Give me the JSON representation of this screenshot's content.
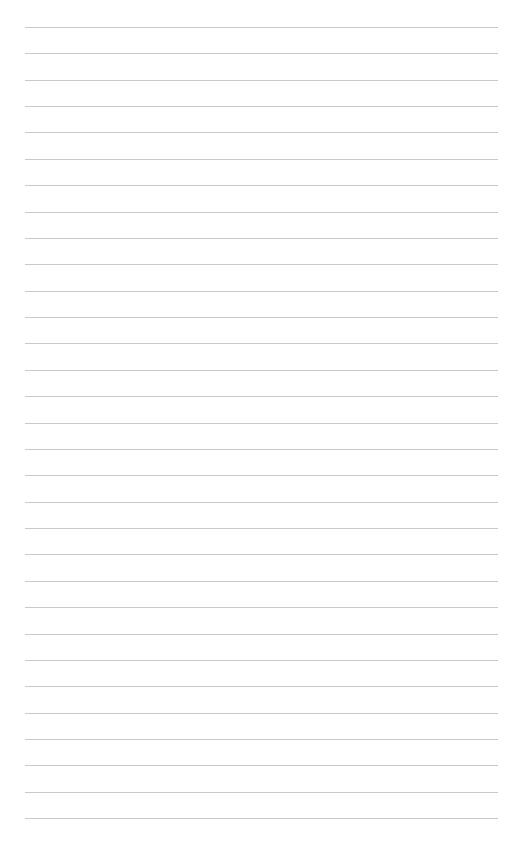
{
  "page": {
    "type": "lined-paper",
    "line_count": 31,
    "first_line_y": 27,
    "line_spacing": 26.37,
    "line_left": 25,
    "line_width": 473,
    "line_color": "#c9c9c9",
    "background": "#ffffff"
  }
}
